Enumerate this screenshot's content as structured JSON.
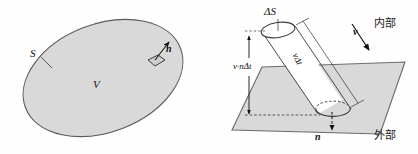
{
  "figure": {
    "panels": [
      {
        "id": "left-panel",
        "name": "closed-surface-panel",
        "labels": {
          "surface": "S",
          "volume": "V",
          "normal": "n"
        }
      },
      {
        "id": "right-panel",
        "name": "flux-cylinder-panel",
        "labels": {
          "area_element": "ΔS",
          "height": "v·nΔt",
          "slant": "vΔt",
          "velocity": "v",
          "normal": "n",
          "inside": "内部",
          "outside": "外部"
        }
      }
    ],
    "colors": {
      "fill": "#d9d9d9",
      "stroke": "#4d4d4d",
      "ink": "#111111",
      "background": "#ffffff"
    }
  }
}
